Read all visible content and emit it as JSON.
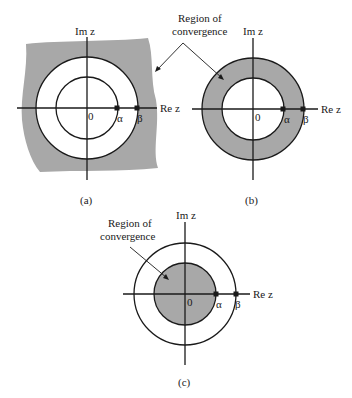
{
  "annotation_top": {
    "line1": "Region of",
    "line2": "convergence"
  },
  "annotation_c": {
    "line1": "Region of",
    "line2": "convergence"
  },
  "axis": {
    "im_label": "Im z",
    "re_label": "Re z",
    "origin": "0"
  },
  "poles": {
    "alpha": "α",
    "beta": "β"
  },
  "panels": [
    {
      "caption": "(a)",
      "roc": "outside outer circle |z| > |β|"
    },
    {
      "caption": "(b)",
      "roc": "annulus |α| < |z| < |β|"
    },
    {
      "caption": "(c)",
      "roc": "inside inner circle |z| < |α|"
    }
  ],
  "colors": {
    "shade": "#a8a8a8",
    "line": "#1a1a1a",
    "background": "#ffffff"
  }
}
